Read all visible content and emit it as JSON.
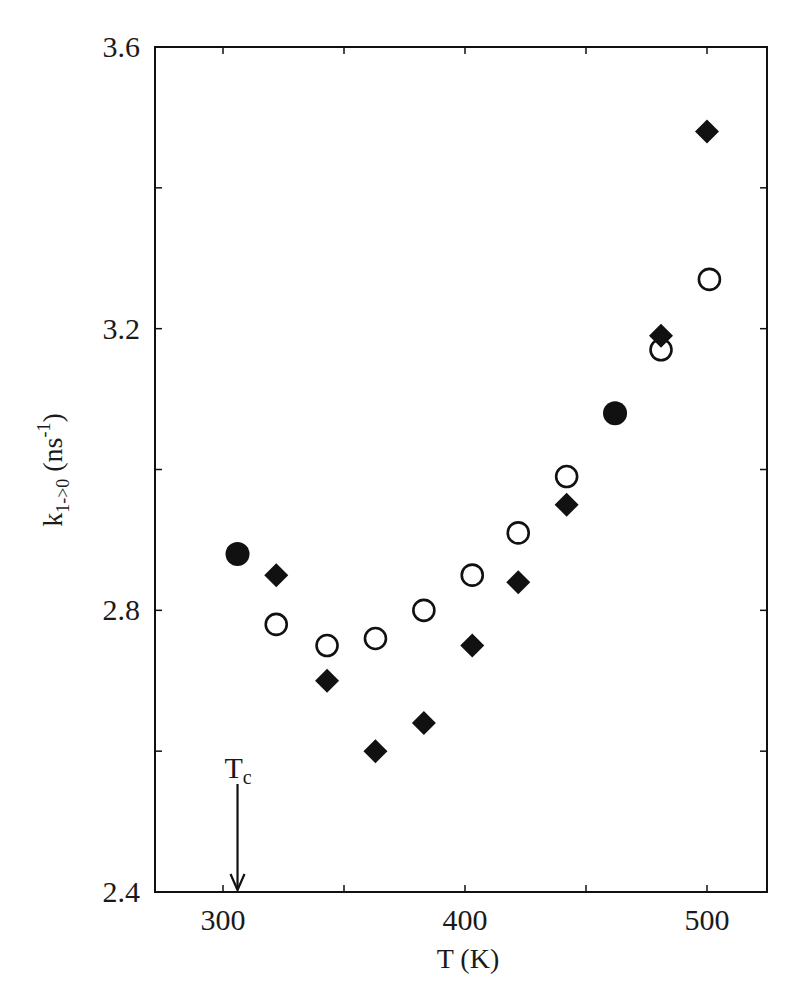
{
  "chart_data": {
    "type": "scatter",
    "title": "",
    "xlabel": "T (K)",
    "ylabel": "k1->0 (ns^-1)",
    "ylabel_parts": {
      "base": "k",
      "subscript": "1->0",
      "unit_open": " (ns",
      "superscript": "-1",
      "unit_close": ")"
    },
    "xlim": [
      272,
      525
    ],
    "ylim": [
      2.4,
      3.6
    ],
    "x_ticks": [
      300,
      350,
      400,
      450,
      500
    ],
    "x_tick_labels": [
      "300",
      "",
      "400",
      "",
      "500"
    ],
    "y_ticks": [
      2.4,
      2.6,
      2.8,
      3.0,
      3.2,
      3.4,
      3.6
    ],
    "y_tick_labels": [
      "2.4",
      "",
      "2.8",
      "",
      "3.2",
      "",
      "3.6"
    ],
    "grid": false,
    "legend": null,
    "annotations": [
      {
        "text_base": "T",
        "text_sub": "c",
        "x": 306,
        "arrow_from_y": 2.62,
        "arrow_to_y": 2.4,
        "type": "arrow-down"
      }
    ],
    "series": [
      {
        "name": "filled-circles",
        "marker": "circle-filled",
        "color": "#111111",
        "x": [
          306,
          462
        ],
        "y": [
          2.88,
          3.08
        ]
      },
      {
        "name": "filled-diamonds",
        "marker": "diamond-filled",
        "color": "#111111",
        "x": [
          322,
          343,
          363,
          383,
          403,
          422,
          442,
          481,
          500
        ],
        "y": [
          2.85,
          2.7,
          2.6,
          2.64,
          2.75,
          2.84,
          2.95,
          3.19,
          3.48
        ]
      },
      {
        "name": "open-circles",
        "marker": "circle-open",
        "color": "#111111",
        "x": [
          322,
          343,
          363,
          383,
          403,
          422,
          442,
          481,
          501
        ],
        "y": [
          2.78,
          2.75,
          2.76,
          2.8,
          2.85,
          2.91,
          2.99,
          3.17,
          3.27
        ]
      }
    ]
  },
  "colors": {
    "ink": "#111111",
    "background": "#ffffff"
  }
}
